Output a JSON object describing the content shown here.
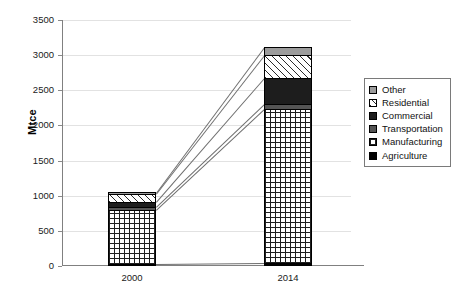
{
  "chart_data": {
    "type": "bar",
    "subtype": "stacked-bar-with-connectors",
    "title": "",
    "xlabel": "",
    "ylabel": "Mtce",
    "categories": [
      "2000",
      "2014"
    ],
    "ylim": [
      0,
      3500
    ],
    "yticks": [
      0,
      500,
      1000,
      1500,
      2000,
      2500,
      3000,
      3500
    ],
    "ytick_labels": [
      "0",
      "500",
      "1000",
      "1500",
      "2000",
      "2500",
      "3000",
      "3500"
    ],
    "grid": true,
    "legend_position": "right",
    "stack_order_bottom_to_top": [
      "Agriculture",
      "Manufacturing",
      "Transportation",
      "Commercial",
      "Residential",
      "Other"
    ],
    "series": [
      {
        "name": "Other",
        "values": [
          10,
          110
        ],
        "pattern": "solid-gray",
        "color": "#9c9c9c"
      },
      {
        "name": "Residential",
        "values": [
          120,
          330
        ],
        "pattern": "diagonal-hatch",
        "color": "#ffffff"
      },
      {
        "name": "Commercial",
        "values": [
          70,
          370
        ],
        "pattern": "solid-black",
        "color": "#1d1d1d"
      },
      {
        "name": "Transportation",
        "values": [
          45,
          70
        ],
        "pattern": "solid-dark-gray",
        "color": "#545454"
      },
      {
        "name": "Manufacturing",
        "values": [
          770,
          2190
        ],
        "pattern": "grid-dots",
        "color": "#ffffff"
      },
      {
        "name": "Agriculture",
        "values": [
          25,
          40
        ],
        "pattern": "solid-black",
        "color": "#000000"
      }
    ],
    "totals": [
      1040,
      3110
    ]
  },
  "legend": {
    "items": [
      {
        "label": "Other"
      },
      {
        "label": "Residential"
      },
      {
        "label": "Commercial"
      },
      {
        "label": "Transportation"
      },
      {
        "label": "Manufacturing"
      },
      {
        "label": "Agriculture"
      }
    ]
  }
}
